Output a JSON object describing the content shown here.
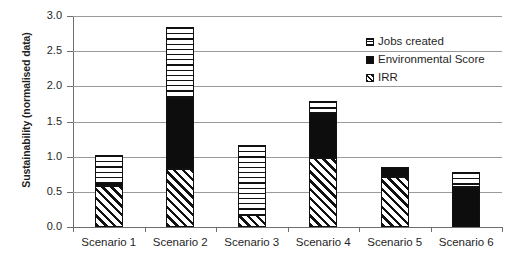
{
  "chart_data": {
    "type": "bar",
    "stacked": true,
    "title": "",
    "xlabel": "",
    "ylabel": "Sustainability (normalised data)",
    "ylim": [
      0.0,
      3.0
    ],
    "ytick_step": 0.5,
    "ytick_labels": [
      "3.0",
      "2.5",
      "2.0",
      "1.5",
      "1.0",
      "0.5",
      "0.0"
    ],
    "ytick_values": [
      3.0,
      2.5,
      2.0,
      1.5,
      1.0,
      0.5,
      0.0
    ],
    "grid": true,
    "legend_position": "top-right",
    "categories": [
      "Scenario 1",
      "Scenario 2",
      "Scenario 3",
      "Scenario 4",
      "Scenario 5",
      "Scenario 6"
    ],
    "series": [
      {
        "name": "IRR",
        "pattern": "diagonal-hatch",
        "color": "#111111",
        "values": [
          0.58,
          0.83,
          0.17,
          0.98,
          0.71,
          0.0
        ]
      },
      {
        "name": "Environmental Score",
        "pattern": "solid-black",
        "color": "#0d0d0d",
        "values": [
          0.05,
          1.01,
          0.0,
          0.64,
          0.14,
          0.57
        ]
      },
      {
        "name": "Jobs created",
        "pattern": "horizontal-lines",
        "color": "#111111",
        "values": [
          0.4,
          1.0,
          0.99,
          0.17,
          0.0,
          0.21
        ]
      }
    ],
    "stack_totals": [
      1.03,
      2.84,
      1.16,
      1.79,
      0.85,
      0.78
    ]
  },
  "legend": {
    "items": [
      {
        "label": "Jobs created",
        "swatch": "sw-jobs"
      },
      {
        "label": "Environmental Score",
        "swatch": "sw-env"
      },
      {
        "label": "IRR",
        "swatch": "sw-irr"
      }
    ]
  },
  "colors": {
    "ink": "#111111",
    "grid": "#9a9a9a",
    "axis": "#6e6e6e",
    "background": "#ffffff"
  }
}
